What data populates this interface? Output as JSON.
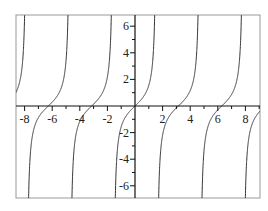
{
  "chart_data": {
    "type": "line",
    "title": "",
    "xlabel": "",
    "ylabel": "",
    "function": "tan(x)",
    "xlim": [
      -8.5,
      9.1
    ],
    "ylim": [
      -6.9,
      6.9
    ],
    "grid": false,
    "legend": null,
    "x_ticks_major": [
      -8,
      -6,
      -4,
      -2,
      2,
      4,
      6,
      8
    ],
    "x_tick_labels": [
      "-8",
      "-6",
      "-4",
      "-2",
      "2",
      "4",
      "6",
      "8"
    ],
    "y_ticks_major": [
      -6,
      -4,
      -2,
      2,
      4,
      6
    ],
    "y_tick_labels": [
      "-6",
      "-4",
      "-2",
      "2",
      "4",
      "6"
    ],
    "minor_tick_step": 1,
    "series": [
      {
        "name": "tan(x)",
        "color": "#333333",
        "zeros": [
          -6.283,
          -3.142,
          0,
          3.142,
          6.283
        ],
        "asymptotes": [
          -7.854,
          -4.712,
          -1.571,
          1.571,
          4.712,
          7.854
        ]
      }
    ]
  },
  "colors": {
    "axis": "#111111",
    "frame": "#999999",
    "curve": "#333333"
  }
}
